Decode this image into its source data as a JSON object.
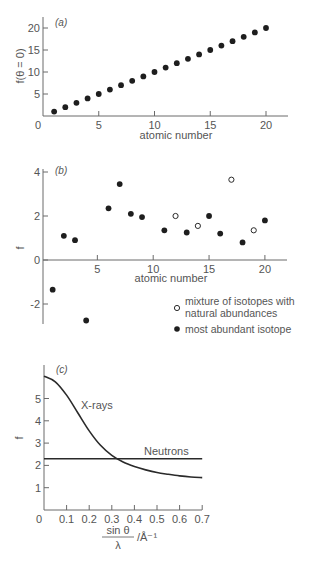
{
  "chart_data": [
    {
      "id": "a",
      "type": "scatter",
      "panel_label": "(a)",
      "title": "",
      "xlabel": "atomic number",
      "ylabel": "f(θ = 0)",
      "xlim": [
        0,
        22
      ],
      "ylim": [
        0,
        22
      ],
      "xticks": [
        0,
        5,
        10,
        15,
        20
      ],
      "yticks": [
        5,
        10,
        15,
        20
      ],
      "grid": false,
      "series": [
        {
          "name": "X-ray form factor",
          "marker": "filled",
          "x": [
            1,
            2,
            3,
            4,
            5,
            6,
            7,
            8,
            9,
            10,
            11,
            12,
            13,
            14,
            15,
            16,
            17,
            18,
            19,
            20
          ],
          "y": [
            1,
            2,
            3,
            4,
            5,
            6,
            7,
            8,
            9,
            10,
            11,
            12,
            13,
            14,
            15,
            16,
            17,
            18,
            19,
            20
          ]
        }
      ]
    },
    {
      "id": "b",
      "type": "scatter",
      "panel_label": "(b)",
      "title": "",
      "xlabel": "atomic number",
      "ylabel": "f",
      "xlim": [
        0,
        22
      ],
      "ylim": [
        -3,
        4
      ],
      "xticks": [
        5,
        10,
        15,
        20
      ],
      "yticks": [
        -2,
        0,
        2,
        4
      ],
      "grid": false,
      "legend_position": "lower right",
      "series": [
        {
          "name": "most abundant isotope",
          "marker": "filled",
          "x": [
            1,
            2,
            3,
            4,
            6,
            7,
            8,
            9,
            11,
            13,
            15,
            16,
            18,
            20
          ],
          "y": [
            -1.35,
            1.1,
            0.9,
            -2.75,
            2.35,
            3.45,
            2.1,
            1.95,
            1.35,
            1.25,
            2.0,
            1.2,
            0.8,
            1.8
          ]
        },
        {
          "name": "mixture of isotopes with natural abundances",
          "marker": "open",
          "x": [
            12,
            14,
            17,
            19
          ],
          "y": [
            2.0,
            1.55,
            3.65,
            1.35
          ]
        }
      ]
    },
    {
      "id": "c",
      "type": "line",
      "panel_label": "(c)",
      "title": "",
      "xlabel": "sin θ / λ /Å⁻¹",
      "ylabel": "f",
      "xlim": [
        0,
        0.7
      ],
      "ylim": [
        0,
        6.2
      ],
      "xticks": [
        0,
        0.1,
        0.2,
        0.3,
        0.4,
        0.5,
        0.6,
        0.7
      ],
      "yticks": [
        1,
        2,
        3,
        4,
        5
      ],
      "grid": false,
      "series": [
        {
          "name": "X-rays",
          "x": [
            0,
            0.05,
            0.1,
            0.15,
            0.2,
            0.25,
            0.3,
            0.35,
            0.4,
            0.45,
            0.5,
            0.55,
            0.6,
            0.65,
            0.7
          ],
          "y": [
            6.0,
            5.75,
            5.15,
            4.35,
            3.55,
            2.9,
            2.45,
            2.15,
            1.95,
            1.8,
            1.68,
            1.6,
            1.53,
            1.48,
            1.45
          ]
        },
        {
          "name": "Neutrons",
          "x": [
            0,
            0.7
          ],
          "y": [
            2.3,
            2.3
          ]
        }
      ]
    }
  ],
  "labels": {
    "a": {
      "panel": "(a)",
      "ylabel": "f(θ = 0)",
      "xlabel": "atomic number",
      "xticks": [
        "0",
        "5",
        "10",
        "15",
        "20"
      ],
      "yticks": [
        "5",
        "10",
        "15",
        "20"
      ]
    },
    "b": {
      "panel": "(b)",
      "ylabel": "f",
      "xlabel": "atomic number",
      "xticks": [
        "5",
        "10",
        "15",
        "20"
      ],
      "yticks": [
        "-2",
        "0",
        "2",
        "4"
      ],
      "legend_open_line1": "mixture of isotopes with",
      "legend_open_line2": "natural abundances",
      "legend_filled": "most abundant isotope"
    },
    "c": {
      "panel": "(c)",
      "ylabel": "f",
      "xlabel_num": "sin θ",
      "xlabel_den": "λ",
      "xlabel_unit": "/Å⁻¹",
      "xrays": "X-rays",
      "neutrons": "Neutrons",
      "xticks": [
        "0",
        "0.1",
        "0.2",
        "0.3",
        "0.4",
        "0.5",
        "0.6",
        "0.7"
      ],
      "yticks": [
        "1",
        "2",
        "3",
        "4",
        "5"
      ]
    }
  }
}
